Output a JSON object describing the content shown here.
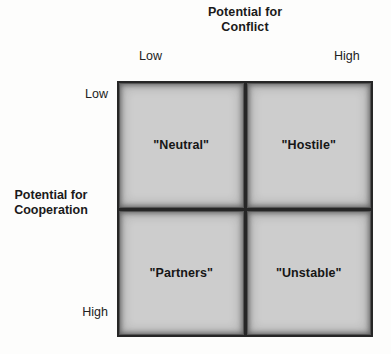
{
  "diagram": {
    "type": "2x2-matrix",
    "x_axis": {
      "title_line1": "Potential for",
      "title_line2": "Conflict",
      "low_label": "Low",
      "high_label": "High"
    },
    "y_axis": {
      "title_line1": "Potential for",
      "title_line2": "Cooperation",
      "low_label": "Low",
      "high_label": "High"
    },
    "quadrants": [
      {
        "position": "top-left",
        "conflict": "Low",
        "cooperation": "Low",
        "label": "\"Neutral\""
      },
      {
        "position": "top-right",
        "conflict": "High",
        "cooperation": "Low",
        "label": "\"Hostile\""
      },
      {
        "position": "bottom-left",
        "conflict": "Low",
        "cooperation": "High",
        "label": "\"Partners\""
      },
      {
        "position": "bottom-right",
        "conflict": "High",
        "cooperation": "High",
        "label": "\"Unstable\""
      }
    ],
    "colors": {
      "cell_fill": "#cdcdcd",
      "cell_border": "#262626",
      "text": "#1a1a1a",
      "background": "#fdfdfc"
    }
  }
}
